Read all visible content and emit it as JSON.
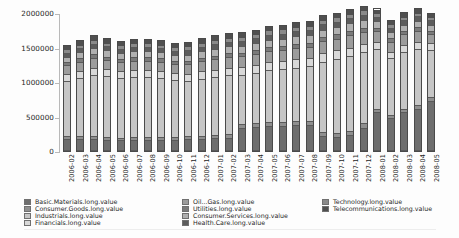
{
  "chart_data": {
    "type": "bar",
    "stacked": true,
    "title": "",
    "xlabel": "",
    "ylabel": "",
    "ylim": [
      0,
      2000000
    ],
    "yticks": [
      0,
      500000,
      1000000,
      1500000,
      2000000
    ],
    "ytick_labels": [
      "0",
      "500000",
      "1000000",
      "1500000",
      "2000000"
    ],
    "grid": false,
    "legend_position": "bottom",
    "categories": [
      "2006-02",
      "2006-03",
      "2006-04",
      "2006-05",
      "2006-06",
      "2006-07",
      "2006-08",
      "2006-09",
      "2006-10",
      "2006-11",
      "2006-12",
      "2007-01",
      "2007-02",
      "2007-03",
      "2007-04",
      "2007-05",
      "2007-06",
      "2007-07",
      "2007-08",
      "2007-09",
      "2007-10",
      "2007-11",
      "2007-12",
      "2008-01",
      "2008-02",
      "2008-03",
      "2008-04",
      "2008-05"
    ],
    "series": [
      {
        "name": "Basic.Materials.long.value",
        "color": "#6e6e6e",
        "values": [
          170000,
          160000,
          165000,
          150000,
          145000,
          150000,
          150000,
          150000,
          150000,
          160000,
          165000,
          175000,
          180000,
          330000,
          345000,
          355000,
          360000,
          365000,
          370000,
          210000,
          195000,
          215000,
          330000,
          560000,
          475000,
          560000,
          610000,
          720000
        ]
      },
      {
        "name": "Consumer.Goods.long.value",
        "color": "#8f8f8f",
        "values": [
          35000,
          40000,
          45000,
          40000,
          35000,
          40000,
          40000,
          40000,
          40000,
          45000,
          45000,
          50000,
          50000,
          55000,
          55000,
          60000,
          60000,
          60000,
          60000,
          60000,
          55000,
          60000,
          60000,
          50000,
          45000,
          45000,
          50000,
          55000
        ]
      },
      {
        "name": "Industrials.long.value",
        "color": "#c6c6c6",
        "values": [
          820000,
          870000,
          900000,
          900000,
          890000,
          890000,
          890000,
          880000,
          840000,
          810000,
          840000,
          850000,
          870000,
          720000,
          740000,
          760000,
          770000,
          790000,
          800000,
          1030000,
          1090000,
          1100000,
          1050000,
          870000,
          830000,
          840000,
          830000,
          700000
        ]
      },
      {
        "name": "Financials.long.value",
        "color": "#d8d8d8",
        "values": [
          95000,
          100000,
          105000,
          100000,
          100000,
          100000,
          100000,
          100000,
          100000,
          105000,
          110000,
          110000,
          115000,
          115000,
          115000,
          120000,
          120000,
          120000,
          120000,
          125000,
          125000,
          130000,
          125000,
          110000,
          100000,
          105000,
          105000,
          95000
        ]
      },
      {
        "name": "Oil...Gas.long.value",
        "color": "#9c9c9c",
        "values": [
          130000,
          135000,
          145000,
          140000,
          135000,
          140000,
          140000,
          135000,
          135000,
          145000,
          150000,
          155000,
          155000,
          160000,
          160000,
          165000,
          165000,
          170000,
          170000,
          175000,
          175000,
          180000,
          175000,
          155000,
          145000,
          150000,
          155000,
          140000
        ]
      },
      {
        "name": "Utilities.long.value",
        "color": "#7a7a7a",
        "values": [
          45000,
          48000,
          50000,
          48000,
          46000,
          48000,
          48000,
          48000,
          48000,
          50000,
          52000,
          54000,
          55000,
          56000,
          56000,
          58000,
          58000,
          58000,
          58000,
          60000,
          60000,
          62000,
          60000,
          52000,
          48000,
          50000,
          52000,
          48000
        ]
      },
      {
        "name": "Consumer.Services.long.value",
        "color": "#b0b0b0",
        "values": [
          85000,
          90000,
          95000,
          92000,
          88000,
          92000,
          92000,
          90000,
          90000,
          95000,
          98000,
          100000,
          102000,
          104000,
          104000,
          108000,
          108000,
          110000,
          110000,
          112000,
          112000,
          115000,
          112000,
          98000,
          92000,
          95000,
          98000,
          88000
        ]
      },
      {
        "name": "Health.Care.long.value",
        "color": "#5c5c5c",
        "values": [
          60000,
          62000,
          65000,
          63000,
          60000,
          63000,
          63000,
          62000,
          62000,
          65000,
          67000,
          69000,
          70000,
          71000,
          71000,
          73000,
          73000,
          74000,
          74000,
          76000,
          76000,
          78000,
          76000,
          67000,
          62000,
          64000,
          66000,
          60000
        ]
      },
      {
        "name": "Technology.long.value",
        "color": "#8a8a8a",
        "values": [
          50000,
          52000,
          55000,
          53000,
          50000,
          53000,
          53000,
          52000,
          52000,
          55000,
          57000,
          58000,
          59000,
          60000,
          60000,
          62000,
          62000,
          63000,
          63000,
          64000,
          64000,
          66000,
          64000,
          56000,
          52000,
          54000,
          56000,
          50000
        ]
      },
      {
        "name": "Telecommunications.long.value",
        "color": "#4f4f4f",
        "values": [
          60000,
          63000,
          65000,
          64000,
          61000,
          64000,
          64000,
          63000,
          63000,
          65000,
          66000,
          69000,
          69000,
          69000,
          69000,
          69000,
          69000,
          70000,
          70000,
          68000,
          68000,
          69000,
          68000,
          62000,
          61000,
          62000,
          63000,
          59000
        ]
      }
    ],
    "legend_columns": [
      [
        "Basic.Materials.long.value",
        "Consumer.Goods.long.value",
        "Industrials.long.value",
        "Financials.long.value"
      ],
      [
        "Oil...Gas.long.value",
        "Utilities.long.value",
        "Consumer.Services.long.value",
        "Health.Care.long.value"
      ],
      [
        "Technology.long.value",
        "Telecommunications.long.value"
      ]
    ]
  }
}
